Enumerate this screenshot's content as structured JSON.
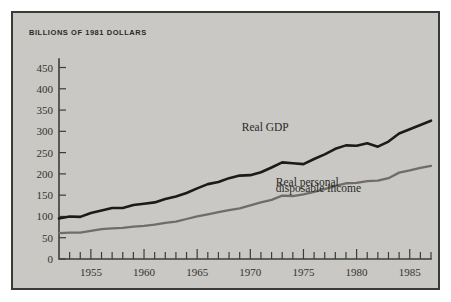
{
  "figure": {
    "title": "BILLIONS OF 1981 DOLLARS",
    "background_color": "#c9c8c4",
    "border_color": "#3a3a38",
    "page_background": "#ffffff"
  },
  "chart_data": {
    "type": "line",
    "title": "BILLIONS OF 1981 DOLLARS",
    "xlabel": "",
    "ylabel": "",
    "xlim": [
      1952,
      1987
    ],
    "ylim": [
      0,
      470
    ],
    "yticks": [
      0,
      50,
      100,
      150,
      200,
      250,
      300,
      350,
      400,
      450
    ],
    "ytick_labels": [
      "0",
      "50",
      "100",
      "150",
      "200",
      "250",
      "300",
      "350",
      "400",
      "450"
    ],
    "xticks": [
      1953,
      1954,
      1955,
      1956,
      1957,
      1958,
      1959,
      1960,
      1961,
      1962,
      1963,
      1964,
      1965,
      1966,
      1967,
      1968,
      1969,
      1970,
      1971,
      1972,
      1973,
      1974,
      1975,
      1976,
      1977,
      1978,
      1979,
      1980,
      1981,
      1982,
      1983,
      1984,
      1985,
      1986,
      1987
    ],
    "xtick_labels": [
      "1955",
      "1960",
      "1965",
      "1970",
      "1975",
      "1980",
      "1985"
    ],
    "xtick_labeled_years": [
      1955,
      1960,
      1965,
      1970,
      1975,
      1980,
      1985
    ],
    "grid": false,
    "legend_position": "inline-annotation",
    "x": [
      1952,
      1953,
      1954,
      1955,
      1956,
      1957,
      1958,
      1959,
      1960,
      1961,
      1962,
      1963,
      1964,
      1965,
      1966,
      1967,
      1968,
      1969,
      1970,
      1971,
      1972,
      1973,
      1974,
      1975,
      1976,
      1977,
      1978,
      1979,
      1980,
      1981,
      1982,
      1983,
      1984,
      1985,
      1986,
      1987
    ],
    "series": [
      {
        "name": "Real GDP",
        "color": "#1c1b19",
        "label_x": 1971,
        "label_y": 305,
        "values": [
          95,
          100,
          99,
          108,
          114,
          120,
          120,
          127,
          130,
          133,
          141,
          147,
          155,
          166,
          176,
          181,
          190,
          196,
          197,
          204,
          215,
          227,
          225,
          223,
          235,
          246,
          259,
          267,
          266,
          272,
          264,
          276,
          295,
          305,
          315,
          325
        ]
      },
      {
        "name": "Real personal disposable income",
        "color": "#6e6d69",
        "label_x": 1973,
        "label_y": 168,
        "label_line_2": "disposable income",
        "values": [
          61,
          62,
          62,
          66,
          70,
          72,
          73,
          76,
          78,
          81,
          85,
          88,
          94,
          100,
          105,
          110,
          115,
          119,
          126,
          133,
          139,
          149,
          148,
          152,
          158,
          164,
          172,
          178,
          179,
          183,
          184,
          190,
          203,
          208,
          214,
          219
        ]
      }
    ],
    "series_labels": [
      {
        "text": "Real GDP",
        "x": 1969.2,
        "y": 300
      },
      {
        "text": "Real personal",
        "x": 1972.4,
        "y": 172
      },
      {
        "text": "disposable income",
        "x": 1972.4,
        "y": 158
      }
    ]
  }
}
